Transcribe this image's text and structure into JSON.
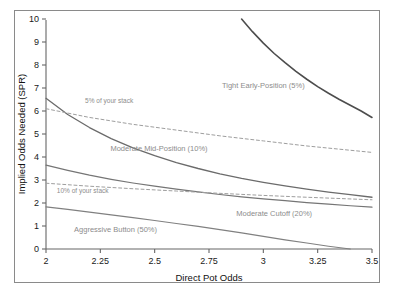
{
  "chart_data": {
    "type": "line",
    "title": "",
    "xlabel": "Direct Pot Odds",
    "ylabel": "Implied Odds Needed (SPR)",
    "xlim": [
      2,
      3.5
    ],
    "ylim": [
      0,
      10
    ],
    "xticks": [
      "2",
      "2.25",
      "2.5",
      "2.75",
      "3",
      "3.25",
      "3.5"
    ],
    "xtick_values": [
      2,
      2.25,
      2.5,
      2.75,
      3,
      3.25,
      3.5
    ],
    "yticks": [
      "0",
      "1",
      "2",
      "3",
      "4",
      "5",
      "6",
      "7",
      "8",
      "9",
      "10"
    ],
    "ytick_values": [
      0,
      1,
      2,
      3,
      4,
      5,
      6,
      7,
      8,
      9,
      10
    ],
    "grid": false,
    "legend_position": "inline-annotations",
    "series": [
      {
        "name": "Tight Early-Position (5%)",
        "style": "solid",
        "color": "#4d4d4d",
        "width": 1.6,
        "label_x": 3.0,
        "label_y": 7.0,
        "x": [
          2.9,
          2.95,
          3.0,
          3.05,
          3.1,
          3.15,
          3.2,
          3.25,
          3.3,
          3.35,
          3.4,
          3.45,
          3.5
        ],
        "y": [
          10.0,
          9.45,
          8.95,
          8.5,
          8.1,
          7.72,
          7.38,
          7.06,
          6.77,
          6.5,
          6.25,
          6.0,
          5.72
        ]
      },
      {
        "name": "Moderate Mid-Position (10%)",
        "style": "solid",
        "color": "#6b6b6b",
        "width": 1.3,
        "label_x": 2.52,
        "label_y": 4.25,
        "x": [
          2.0,
          2.1,
          2.2,
          2.3,
          2.4,
          2.5,
          2.6,
          2.7,
          2.8,
          2.9,
          3.0,
          3.1,
          3.2,
          3.3,
          3.4,
          3.5
        ],
        "y": [
          6.55,
          5.85,
          5.28,
          4.8,
          4.4,
          4.06,
          3.76,
          3.5,
          3.27,
          3.07,
          2.9,
          2.74,
          2.6,
          2.47,
          2.36,
          2.25
        ]
      },
      {
        "name": "Moderate Cutoff (20%)",
        "style": "solid",
        "color": "#757575",
        "width": 1.2,
        "label_x": 3.05,
        "label_y": 1.45,
        "x": [
          2.0,
          2.1,
          2.2,
          2.3,
          2.4,
          2.5,
          2.6,
          2.7,
          2.8,
          2.9,
          3.0,
          3.1,
          3.2,
          3.3,
          3.4,
          3.5
        ],
        "y": [
          3.65,
          3.42,
          3.21,
          3.03,
          2.87,
          2.73,
          2.6,
          2.48,
          2.37,
          2.27,
          2.18,
          2.1,
          2.02,
          1.95,
          1.88,
          1.82
        ]
      },
      {
        "name": "Aggressive Button (50%)",
        "style": "solid",
        "color": "#808080",
        "width": 1.2,
        "label_x": 2.32,
        "label_y": 0.75,
        "x": [
          2.0,
          2.1,
          2.2,
          2.3,
          2.4,
          2.5,
          2.6,
          2.7,
          2.8,
          2.9,
          3.0,
          3.1,
          3.2,
          3.3,
          3.4
        ],
        "y": [
          1.83,
          1.72,
          1.6,
          1.48,
          1.36,
          1.24,
          1.11,
          0.98,
          0.84,
          0.7,
          0.55,
          0.4,
          0.26,
          0.12,
          0.0
        ]
      },
      {
        "name": "5% of your stack",
        "style": "dashed",
        "color": "#9e9e9e",
        "width": 1.0,
        "label_x": 2.18,
        "label_y": 6.35,
        "x": [
          2.0,
          2.2,
          2.4,
          2.6,
          2.8,
          3.0,
          3.2,
          3.5
        ],
        "y": [
          6.1,
          5.72,
          5.42,
          5.17,
          4.92,
          4.7,
          4.48,
          4.2
        ]
      },
      {
        "name": "10% of your stack",
        "style": "dashed",
        "color": "#9e9e9e",
        "width": 1.0,
        "label_x": 2.05,
        "label_y": 2.42,
        "x": [
          2.0,
          2.2,
          2.4,
          2.6,
          2.8,
          3.0,
          3.2,
          3.5
        ],
        "y": [
          2.86,
          2.73,
          2.62,
          2.52,
          2.42,
          2.33,
          2.25,
          2.14
        ]
      }
    ]
  }
}
